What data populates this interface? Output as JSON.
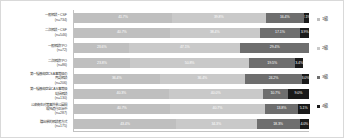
{
  "chart_data": {
    "type": "bar",
    "orientation": "horizontal",
    "stacked": true,
    "normalized_percent": true,
    "title": "",
    "xlabel": "",
    "ylabel": "",
    "xlim": [
      0,
      100
    ],
    "grid": false,
    "legend_position": "right",
    "categories": [
      "一般相談・CSF\n(n=734)",
      "二次相談・CSF\n(n=546)",
      "一般相談TPO\n(n=72)",
      "二次相談TPO\n(n=86)",
      "第一種感染症CSA事等級の\n再認相談\n(n=206)",
      "第一種感染症全CAS事等級\n総括相談\n(n=130)",
      "公衆衛生対策事外業公園間\n現地進行正治中\n(n=287)",
      "職出単的相談者方式\n(n=175)"
    ],
    "series": [
      {
        "name": "1級",
        "color": "#bfbfbf",
        "values": [
          41.7,
          40.7,
          23.6,
          23.8,
          36.4,
          40.3,
          40.7,
          43.4
        ],
        "labels": [
          "41.7%",
          "40.7%",
          "23.6%",
          "23.8%",
          "36.4%",
          "40.3%",
          "40.7%",
          "43.4%"
        ]
      },
      {
        "name": "2級",
        "color": "#c9c9c9",
        "values": [
          39.8,
          38.4,
          47.1,
          50.8,
          36.4,
          40.0,
          40.7,
          34.3
        ],
        "labels": [
          "39.8%",
          "38.4%",
          "47.1%",
          "50.8%",
          "36.4%",
          "40.0%",
          "40.7%",
          "34.3%"
        ]
      },
      {
        "name": "3級",
        "color": "#6e6e6e",
        "values": [
          16.4,
          17.1,
          29.4,
          19.5,
          24.2,
          10.7,
          13.8,
          18.3
        ],
        "labels": [
          "16.4%",
          "17.1%",
          "29.4%",
          "19.5%",
          "24.2%",
          "10.7%",
          "13.8%",
          "18.3%"
        ]
      },
      {
        "name": "4級",
        "color": "#1a1a1a",
        "values": [
          2.1,
          3.9,
          0.0,
          3.4,
          3.0,
          9.0,
          5.1,
          4.0
        ],
        "labels": [
          "2.1%",
          "3.9%",
          "",
          "3.4%",
          "3.0%",
          "9.0%",
          "5.1%",
          "4.0%"
        ]
      }
    ],
    "legend": [
      "1級",
      "2級",
      "3級",
      "4級"
    ]
  }
}
